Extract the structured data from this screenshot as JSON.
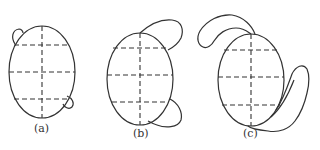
{
  "figure": {
    "top_caption_fragment": "",
    "panels": [
      {
        "id": "a",
        "label": "(a)"
      },
      {
        "id": "b",
        "label": "(b)"
      },
      {
        "id": "c",
        "label": "(c)"
      }
    ]
  },
  "colors": {
    "stroke": "#333333",
    "background": "#ffffff"
  }
}
